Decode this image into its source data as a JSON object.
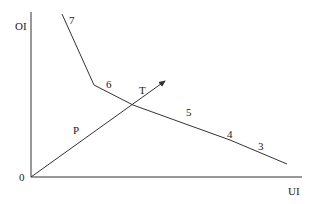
{
  "diagram": {
    "axes": {
      "y_label": "OI",
      "x_label": "UI",
      "origin_label": "0"
    },
    "curve": {
      "name": "indifference-curve",
      "points": [
        [
          62,
          14
        ],
        [
          94,
          85
        ],
        [
          133,
          105
        ],
        [
          180,
          122
        ],
        [
          230,
          140
        ],
        [
          287,
          164
        ]
      ],
      "point_labels": [
        "7",
        "6",
        "5",
        "4",
        "3"
      ]
    },
    "ray": {
      "name": "P",
      "label": "P",
      "arrow_label": "T"
    },
    "colors": {
      "line": "#333333",
      "background": "#ffffff"
    }
  }
}
